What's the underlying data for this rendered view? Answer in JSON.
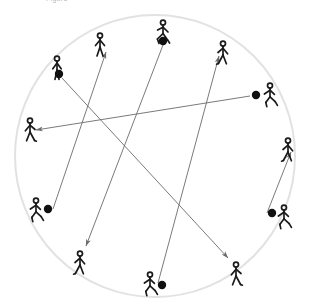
{
  "figure": {
    "caption": "Figure",
    "canvas": {
      "width": 310,
      "height": 305
    },
    "background_color": "#ffffff"
  },
  "field": {
    "shape_name": "circular-field",
    "center_x": 155,
    "center_y": 156,
    "radius_x": 140,
    "radius_y": 141,
    "stroke_color": "#e2e2e2",
    "stroke_width": 2
  },
  "style": {
    "player_color": "#1a1a1a",
    "ball_color": "#111111",
    "arrow_color": "#6b6b6b",
    "arrow_width": 0.9,
    "ball_radius": 4.2
  },
  "players": [
    {
      "id": "p1",
      "name": "player-upper-left-with-ball",
      "x": 57,
      "y": 56,
      "pose": "dribble",
      "facing": "front",
      "has_ball": true,
      "ball_x": 59,
      "ball_y": 74
    },
    {
      "id": "p2",
      "name": "player-top-left-target",
      "x": 100,
      "y": 33,
      "pose": "stand",
      "facing": "front",
      "has_ball": false
    },
    {
      "id": "p3",
      "name": "player-top-with-ball",
      "x": 163,
      "y": 20,
      "pose": "run",
      "facing": "right",
      "has_ball": true,
      "ball_x": 163,
      "ball_y": 41
    },
    {
      "id": "p4",
      "name": "player-top-right-target",
      "x": 223,
      "y": 41,
      "pose": "walk",
      "facing": "right",
      "has_ball": false
    },
    {
      "id": "p5",
      "name": "player-right-upper-with-ball",
      "x": 270,
      "y": 83,
      "pose": "kick",
      "facing": "right",
      "has_ball": true,
      "ball_x": 256,
      "ball_y": 95
    },
    {
      "id": "p6",
      "name": "player-right-mid-target",
      "x": 288,
      "y": 138,
      "pose": "walk",
      "facing": "right",
      "has_ball": false
    },
    {
      "id": "p7",
      "name": "player-left-mid-target",
      "x": 30,
      "y": 118,
      "pose": "walk",
      "facing": "left",
      "has_ball": false
    },
    {
      "id": "p8",
      "name": "player-left-lower-with-ball",
      "x": 36,
      "y": 198,
      "pose": "kick",
      "facing": "right",
      "has_ball": true,
      "ball_x": 48,
      "ball_y": 209
    },
    {
      "id": "p9",
      "name": "player-bottom-left-target",
      "x": 80,
      "y": 251,
      "pose": "walk",
      "facing": "right",
      "has_ball": false
    },
    {
      "id": "p10",
      "name": "player-bottom-with-ball",
      "x": 150,
      "y": 272,
      "pose": "kick",
      "facing": "right",
      "has_ball": true,
      "ball_x": 162,
      "ball_y": 285
    },
    {
      "id": "p11",
      "name": "player-bottom-right-target",
      "x": 236,
      "y": 262,
      "pose": "walk",
      "facing": "left",
      "has_ball": false
    },
    {
      "id": "p12",
      "name": "player-right-lower-with-ball",
      "x": 284,
      "y": 205,
      "pose": "kick",
      "facing": "right",
      "has_ball": true,
      "ball_x": 272,
      "ball_y": 213
    }
  ],
  "passes": [
    {
      "id": "a1",
      "name": "pass-upper-left-to-bottom-right",
      "from": "p1",
      "x1": 62,
      "y1": 78,
      "x2": 228,
      "y2": 258
    },
    {
      "id": "a2",
      "name": "pass-top-to-bottom-left",
      "from": "p3",
      "x1": 163,
      "y1": 45,
      "x2": 86,
      "y2": 246
    },
    {
      "id": "a3",
      "name": "pass-right-upper-to-left-mid",
      "from": "p5",
      "x1": 250,
      "y1": 96,
      "x2": 36,
      "y2": 130
    },
    {
      "id": "a4",
      "name": "pass-left-lower-to-top-left",
      "from": "p8",
      "x1": 53,
      "y1": 209,
      "x2": 106,
      "y2": 52
    },
    {
      "id": "a5",
      "name": "pass-bottom-to-top-right",
      "from": "p10",
      "x1": 158,
      "y1": 283,
      "x2": 219,
      "y2": 56
    },
    {
      "id": "a6",
      "name": "pass-right-lower-to-right-mid",
      "from": "p12",
      "x1": 267,
      "y1": 213,
      "x2": 291,
      "y2": 152
    }
  ],
  "summary": {
    "player_count": 12,
    "ball_count": 6,
    "pass_count": 6
  }
}
